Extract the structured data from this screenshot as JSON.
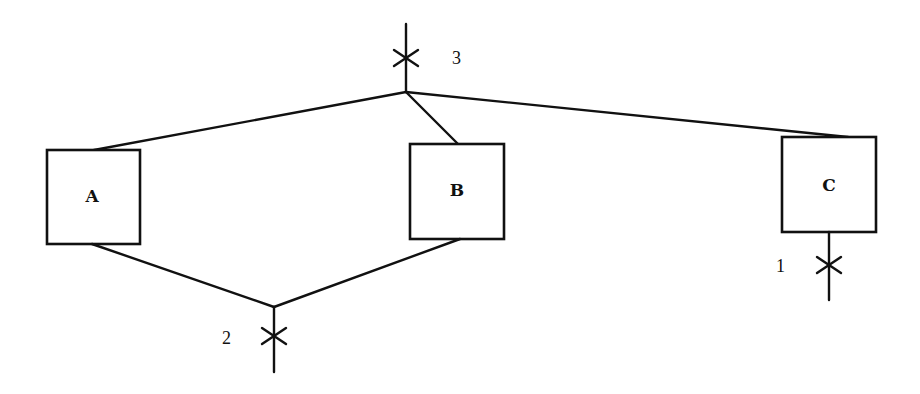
{
  "diagram": {
    "nodes": [
      {
        "id": "A",
        "label": "A"
      },
      {
        "id": "B",
        "label": "B"
      },
      {
        "id": "C",
        "label": "C"
      }
    ],
    "cut_points": [
      {
        "id": "1",
        "label": "1"
      },
      {
        "id": "2",
        "label": "2"
      },
      {
        "id": "3",
        "label": "3"
      }
    ],
    "edges": [
      {
        "from": "junction-top",
        "to": "A"
      },
      {
        "from": "junction-top",
        "to": "B"
      },
      {
        "from": "junction-top",
        "to": "C"
      },
      {
        "from": "A",
        "to": "junction-bottom"
      },
      {
        "from": "B",
        "to": "junction-bottom"
      }
    ]
  }
}
